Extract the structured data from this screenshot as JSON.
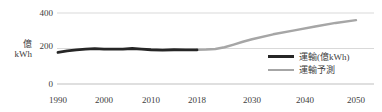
{
  "chart_data": {
    "type": "line",
    "title": "",
    "subtitle": "",
    "xlabel": "",
    "ylabel": "億\nkWh",
    "ylabel_lines": [
      "億",
      "kWh"
    ],
    "ylim": [
      0,
      400
    ],
    "yticks": [
      0,
      200,
      400
    ],
    "ytick_labels": [
      "0",
      "200",
      "400"
    ],
    "xticks": [
      1990,
      2000,
      2010,
      2018,
      2030,
      2040,
      2050
    ],
    "xtick_labels": [
      "1990",
      "2000",
      "2010",
      "2018",
      "2030",
      "2040",
      "2050"
    ],
    "xlim": [
      1990,
      2050
    ],
    "grid": true,
    "grid_axis": "y",
    "legend_position": "lower right",
    "series": [
      {
        "name": "運輸(億kWh)",
        "color": "#262626",
        "width": 3,
        "x": [
          1990,
          1992,
          1994,
          1996,
          1998,
          2000,
          2002,
          2004,
          2006,
          2008,
          2010,
          2012,
          2014,
          2016,
          2018
        ],
        "values": [
          178,
          186,
          192,
          196,
          199,
          197,
          196,
          197,
          200,
          197,
          193,
          191,
          193,
          192,
          192
        ]
      },
      {
        "name": "運輸予測",
        "color": "#a6a6a6",
        "width": 2,
        "x": [
          2018,
          2020,
          2022,
          2024,
          2026,
          2028,
          2030,
          2034,
          2038,
          2042,
          2046,
          2050
        ],
        "values": [
          193,
          194,
          197,
          207,
          222,
          238,
          252,
          280,
          302,
          324,
          344,
          360
        ]
      }
    ]
  },
  "legend": {
    "items": [
      {
        "label": "運輸(億kWh)",
        "swatch": "line-swatch-historical"
      },
      {
        "label": "運輸予測",
        "swatch": "line-swatch-forecast"
      }
    ]
  },
  "axis": {
    "y_title_top": "億",
    "y_title_bottom": "kWh",
    "ytick_0": "0",
    "ytick_200": "200",
    "ytick_400": "400",
    "xtick_1990": "1990",
    "xtick_2000": "2000",
    "xtick_2010": "2010",
    "xtick_2018": "2018",
    "xtick_2030": "2030",
    "xtick_2040": "2040",
    "xtick_2050": "2050"
  },
  "colors": {
    "historical_line": "#262626",
    "forecast_line": "#a6a6a6",
    "gridline": "#d9d9d9",
    "text": "#404040",
    "background": "#ffffff"
  }
}
